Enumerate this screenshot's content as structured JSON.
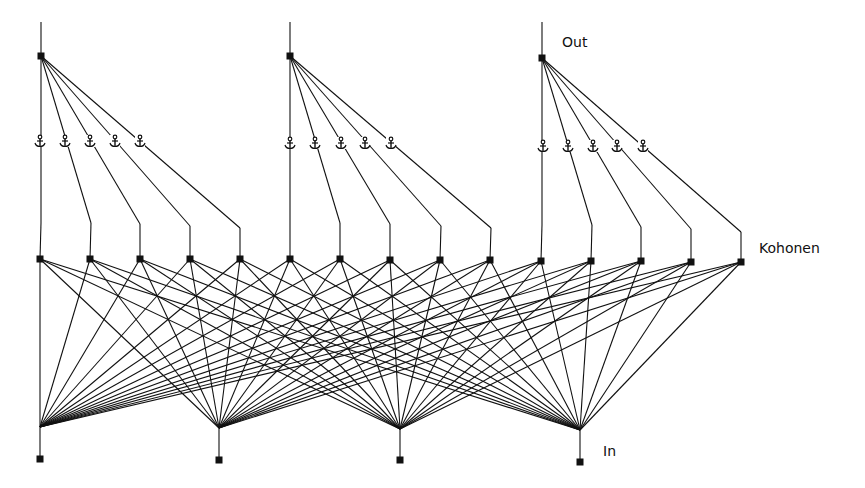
{
  "diagram": {
    "colors": {
      "line": "#111111",
      "node": "#111111",
      "background": "#ffffff"
    },
    "labels": {
      "out": {
        "text": "Out",
        "x": 562,
        "y": 34
      },
      "kohonen": {
        "text": "Kohonen",
        "x": 759,
        "y": 240
      },
      "in": {
        "text": "In",
        "x": 603,
        "y": 443
      }
    },
    "top_y": 22,
    "output_nodes": [
      {
        "x": 41,
        "y": 56,
        "fan_to": [
          0,
          1,
          2,
          3,
          4
        ],
        "bends": [
          [
            41,
            223
          ],
          [
            91,
            223
          ],
          [
            140,
            224
          ],
          [
            190,
            226
          ],
          [
            240,
            228
          ]
        ],
        "anchors_x": [
          40,
          65,
          90,
          115,
          140
        ],
        "anchor_y": 140
      },
      {
        "x": 290,
        "y": 56,
        "fan_to": [
          5,
          6,
          7,
          8,
          9
        ],
        "bends": [
          [
            290,
            223
          ],
          [
            340,
            223
          ],
          [
            390,
            224
          ],
          [
            441,
            226
          ],
          [
            491,
            228
          ]
        ],
        "anchors_x": [
          290,
          315,
          341,
          365,
          391
        ],
        "anchor_y": 142
      },
      {
        "x": 542,
        "y": 58,
        "fan_to": [
          10,
          11,
          12,
          13,
          14
        ],
        "bends": [
          [
            542,
            225
          ],
          [
            592,
            225
          ],
          [
            641,
            227
          ],
          [
            691,
            229
          ],
          [
            741,
            232
          ]
        ],
        "anchors_x": [
          543,
          568,
          593,
          617,
          643
        ],
        "anchor_y": 145
      }
    ],
    "kohonen_nodes": [
      {
        "x": 40,
        "y": 259
      },
      {
        "x": 90,
        "y": 259
      },
      {
        "x": 140,
        "y": 259
      },
      {
        "x": 190,
        "y": 259
      },
      {
        "x": 240,
        "y": 259
      },
      {
        "x": 290,
        "y": 259
      },
      {
        "x": 340,
        "y": 259
      },
      {
        "x": 390,
        "y": 260
      },
      {
        "x": 440,
        "y": 260
      },
      {
        "x": 490,
        "y": 260
      },
      {
        "x": 541,
        "y": 261
      },
      {
        "x": 591,
        "y": 261
      },
      {
        "x": 641,
        "y": 261
      },
      {
        "x": 691,
        "y": 262
      },
      {
        "x": 741,
        "y": 262
      }
    ],
    "input_nodes": [
      {
        "x": 40,
        "y": 459,
        "junction_y": 427
      },
      {
        "x": 219,
        "y": 460,
        "junction_y": 428
      },
      {
        "x": 400,
        "y": 460,
        "junction_y": 429
      },
      {
        "x": 580,
        "y": 462,
        "junction_y": 430
      }
    ],
    "node_size": 7,
    "anchor_icon": "anchor-icon"
  }
}
